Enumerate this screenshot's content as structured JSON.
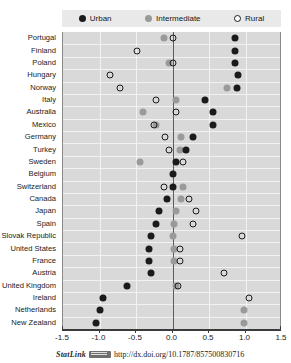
{
  "legend": {
    "items": [
      {
        "label": "Urban",
        "icon": "filled-dark-circle-icon",
        "color": "#1b1b1b"
      },
      {
        "label": "Intermediate",
        "icon": "filled-gray-circle-icon",
        "color": "#9a9a9a"
      },
      {
        "label": "Rural",
        "icon": "open-circle-icon",
        "color": "#ffffff"
      }
    ]
  },
  "footer": {
    "statlink_label": "StatLink",
    "badge_icon": "statlink-barcode-icon",
    "doi_url": "http://dx.doi.org/10.1787/857500830716"
  },
  "chart_data": {
    "type": "scatter",
    "title": "",
    "subtitle": "",
    "xlabel": "",
    "ylabel": "",
    "xlim": [
      -1.5,
      1.5
    ],
    "xticks": [
      -1.5,
      -1.0,
      -0.5,
      0.0,
      0.5,
      1.0,
      1.5
    ],
    "xticklabels": [
      "-1.5",
      "-1.0",
      "-0.5",
      "0.0",
      "0.5",
      "1.0",
      "1.5"
    ],
    "grid": true,
    "grid_axis": "x",
    "zero_reference_line": 0.0,
    "legend_position": "top",
    "orientation": "horizontal",
    "categories": [
      "Portugal",
      "Finland",
      "Poland",
      "Hungary",
      "Norway",
      "Italy",
      "Australia",
      "Mexico",
      "Germany",
      "Turkey",
      "Sweden",
      "Belgium",
      "Switzerland",
      "Canada",
      "Japan",
      "Spain",
      "Slovak Republic",
      "United States",
      "France",
      "Austria",
      "United Kingdom",
      "Ireland",
      "Netherlands",
      "New Zealand"
    ],
    "series": [
      {
        "name": "Urban",
        "marker": "filled-dark-circle",
        "color": "#1b1b1b",
        "values": [
          0.85,
          0.85,
          0.85,
          0.9,
          0.88,
          0.45,
          0.55,
          0.55,
          0.28,
          0.18,
          0.05,
          0.0,
          0.0,
          -0.08,
          -0.18,
          -0.22,
          -0.3,
          -0.32,
          -0.32,
          -0.3,
          -0.62,
          -0.95,
          -1.0,
          -1.05
        ]
      },
      {
        "name": "Intermediate",
        "marker": "filled-gray-circle",
        "color": "#9a9a9a",
        "values": [
          -0.12,
          null,
          -0.05,
          null,
          0.75,
          0.05,
          -0.4,
          -0.22,
          0.12,
          0.1,
          -0.45,
          null,
          0.15,
          0.12,
          0.05,
          0.02,
          0.0,
          0.02,
          0.02,
          null,
          0.05,
          null,
          0.98,
          0.98
        ]
      },
      {
        "name": "Rural",
        "marker": "open-circle",
        "color": "#ffffff",
        "values": [
          0.0,
          -0.48,
          0.0,
          -0.85,
          -0.72,
          -0.22,
          0.05,
          -0.25,
          -0.1,
          -0.05,
          0.15,
          null,
          -0.12,
          0.22,
          0.32,
          0.28,
          0.95,
          0.1,
          0.1,
          0.7,
          0.08,
          1.05,
          null,
          null
        ]
      }
    ]
  }
}
